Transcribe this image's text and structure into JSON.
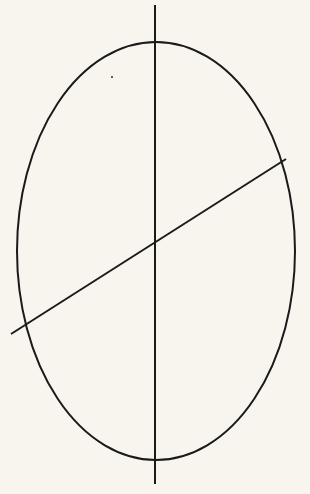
{
  "diagram": {
    "background": "#f7f5ee",
    "stroke_color": "#1a1a1a",
    "ellipse": {
      "cx": 156,
      "cy": 251,
      "rx": 139,
      "ry": 209,
      "stroke_width": 2
    },
    "vertical_axis": {
      "x1": 155,
      "y1": 5,
      "x2": 155,
      "y2": 484,
      "stroke_width": 2
    },
    "diagonal_line": {
      "x1": 11,
      "y1": 334,
      "x2": 286,
      "y2": 159,
      "stroke_width": 2
    },
    "dot": {
      "cx": 112,
      "cy": 77,
      "r": 0.9
    }
  }
}
